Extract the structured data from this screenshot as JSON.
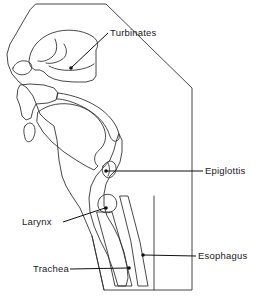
{
  "figure": {
    "type": "anatomical-line-diagram",
    "background_color": "#ffffff",
    "line_color": "#333333",
    "fill_pattern": "stipple-halftone-gray",
    "fill_color_light": "#cfcfcf",
    "fill_color_dark": "#9a9a9a",
    "label_color": "#1a1a1a"
  },
  "labels": {
    "turbinates": {
      "text": "Turbinates",
      "text_x": 110,
      "text_y": 35,
      "target_x": 71,
      "target_y": 68
    },
    "epiglottis": {
      "text": "Epiglottis",
      "text_x": 205,
      "text_y": 174,
      "target_x": 106,
      "target_y": 171
    },
    "larynx": {
      "text": "Larynx",
      "text_x": 22,
      "text_y": 225,
      "target_x": 106,
      "target_y": 208
    },
    "esophagus": {
      "text": "Esophagus",
      "text_x": 198,
      "text_y": 259,
      "target_x": 143,
      "target_y": 255
    },
    "trachea": {
      "text": "Trachea",
      "text_x": 33,
      "text_y": 272,
      "target_x": 129,
      "target_y": 268
    }
  },
  "structures": [
    {
      "name": "head-soft-tissue-block",
      "fill": "stipple-light"
    },
    {
      "name": "nasal-cavity",
      "fill": "white"
    },
    {
      "name": "turbinate-folds",
      "fill": "white"
    },
    {
      "name": "hard-palate",
      "fill": "stipple-dark"
    },
    {
      "name": "soft-palate",
      "fill": "stipple-dark"
    },
    {
      "name": "tongue",
      "fill": "stipple-light"
    },
    {
      "name": "epiglottis-flap",
      "fill": "white"
    },
    {
      "name": "larynx-cavity",
      "fill": "white"
    },
    {
      "name": "trachea-airway",
      "fill": "white"
    },
    {
      "name": "esophagus-band",
      "fill": "stipple-dark"
    }
  ]
}
